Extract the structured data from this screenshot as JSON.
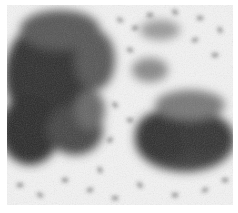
{
  "image": {
    "subject": "grayscale micrograph of rod-shaped bacteria clusters",
    "background_color": "#f4f4f4",
    "cluster_color": "#3a3a3a",
    "rod_color": "#4a4a4a",
    "clusters": [
      {
        "name": "left-cluster",
        "cx": 60,
        "cy": 100,
        "rx": 55,
        "ry": 75
      },
      {
        "name": "right-cluster",
        "cx": 180,
        "cy": 135,
        "rx": 55,
        "ry": 40
      }
    ]
  }
}
